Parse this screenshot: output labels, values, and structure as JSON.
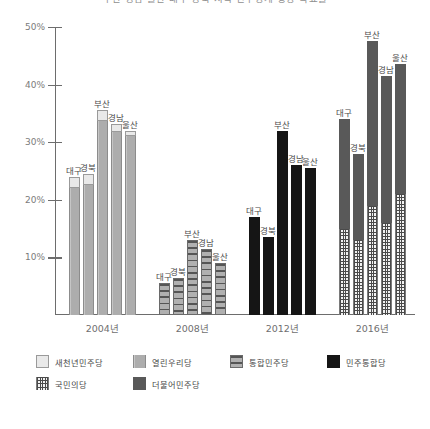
{
  "chart_data": {
    "type": "bar",
    "title": "부산 경남 울산 대구 경북 지역 민주당계 정당 득표율",
    "subtitle": "",
    "xlabel": "",
    "ylabel": "",
    "ylim": [
      0,
      50
    ],
    "ytick_labels": [
      "10%",
      "20%",
      "30%",
      "40%",
      "50%"
    ],
    "ytick_values": [
      10,
      20,
      30,
      40,
      50
    ],
    "grid": false,
    "legend_position": "bottom",
    "categories": [
      "2004년",
      "2008년",
      "2012년",
      "2016년"
    ],
    "region_order": [
      "대구",
      "경북",
      "부산",
      "경남",
      "울산"
    ],
    "groups": [
      {
        "category": "2004년",
        "bars": [
          {
            "region": "대구",
            "total": 24.0,
            "segments": [
              {
                "party": "열린우리당",
                "value": 22.0
              },
              {
                "party": "새천년민주당",
                "value": 2.0
              }
            ]
          },
          {
            "region": "경북",
            "total": 24.5,
            "segments": [
              {
                "party": "열린우리당",
                "value": 22.6
              },
              {
                "party": "새천년민주당",
                "value": 1.9
              }
            ]
          },
          {
            "region": "부산",
            "total": 35.6,
            "segments": [
              {
                "party": "열린우리당",
                "value": 33.7
              },
              {
                "party": "새천년민주당",
                "value": 1.9
              }
            ]
          },
          {
            "region": "경남",
            "total": 33.1,
            "segments": [
              {
                "party": "열린우리당",
                "value": 31.7
              },
              {
                "party": "새천년민주당",
                "value": 1.4
              }
            ]
          },
          {
            "region": "울산",
            "total": 32.0,
            "segments": [
              {
                "party": "열린우리당",
                "value": 31.0
              },
              {
                "party": "새천년민주당",
                "value": 1.0
              }
            ]
          }
        ]
      },
      {
        "category": "2008년",
        "bars": [
          {
            "region": "대구",
            "total": 5.5,
            "segments": [
              {
                "party": "통합민주당",
                "value": 5.5
              }
            ]
          },
          {
            "region": "경북",
            "total": 6.5,
            "segments": [
              {
                "party": "통합민주당",
                "value": 6.5
              }
            ]
          },
          {
            "region": "부산",
            "total": 13.0,
            "segments": [
              {
                "party": "통합민주당",
                "value": 13.0
              }
            ]
          },
          {
            "region": "경남",
            "total": 11.5,
            "segments": [
              {
                "party": "통합민주당",
                "value": 11.5
              }
            ]
          },
          {
            "region": "울산",
            "total": 9.0,
            "segments": [
              {
                "party": "통합민주당",
                "value": 9.0
              }
            ]
          }
        ]
      },
      {
        "category": "2012년",
        "bars": [
          {
            "region": "대구",
            "total": 17.0,
            "segments": [
              {
                "party": "민주통합당",
                "value": 17.0
              }
            ]
          },
          {
            "region": "경북",
            "total": 13.5,
            "segments": [
              {
                "party": "민주통합당",
                "value": 13.5
              }
            ]
          },
          {
            "region": "부산",
            "total": 32.0,
            "segments": [
              {
                "party": "민주통합당",
                "value": 32.0
              }
            ]
          },
          {
            "region": "경남",
            "total": 26.0,
            "segments": [
              {
                "party": "민주통합당",
                "value": 26.0
              }
            ]
          },
          {
            "region": "울산",
            "total": 25.6,
            "segments": [
              {
                "party": "민주통합당",
                "value": 25.6
              }
            ]
          }
        ]
      },
      {
        "category": "2016년",
        "bars": [
          {
            "region": "대구",
            "total": 34.0,
            "segments": [
              {
                "party": "국민의당",
                "value": 15.0
              },
              {
                "party": "더불어민주당",
                "value": 19.0
              }
            ]
          },
          {
            "region": "경북",
            "total": 28.0,
            "segments": [
              {
                "party": "국민의당",
                "value": 13.0
              },
              {
                "party": "더불어민주당",
                "value": 15.0
              }
            ]
          },
          {
            "region": "부산",
            "total": 47.5,
            "segments": [
              {
                "party": "국민의당",
                "value": 19.0
              },
              {
                "party": "더불어민주당",
                "value": 28.5
              }
            ]
          },
          {
            "region": "경남",
            "total": 41.5,
            "segments": [
              {
                "party": "국민의당",
                "value": 16.0
              },
              {
                "party": "더불어민주당",
                "value": 25.5
              }
            ]
          },
          {
            "region": "울산",
            "total": 43.5,
            "segments": [
              {
                "party": "국민의당",
                "value": 21.0
              },
              {
                "party": "더불어민주당",
                "value": 22.5
              }
            ]
          }
        ]
      }
    ],
    "legend": [
      {
        "label": "새천년민주당",
        "pattern": "light-solid",
        "color": "#e9e9e9"
      },
      {
        "label": "열린우리당",
        "pattern": "medium-vertical",
        "color": "#adadad"
      },
      {
        "label": "통합민주당",
        "pattern": "horizontal-stripe",
        "color": "#9e9e9e"
      },
      {
        "label": "민주통합당",
        "pattern": "black-solid",
        "color": "#151515"
      },
      {
        "label": "국민의당",
        "pattern": "grid-hatch",
        "color": "#f2f2f2"
      },
      {
        "label": "더불어민주당",
        "pattern": "dark-solid",
        "color": "#595959"
      }
    ]
  }
}
